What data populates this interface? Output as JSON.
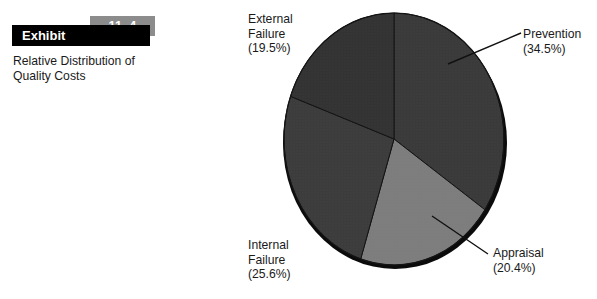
{
  "exhibit": {
    "label": "Exhibit",
    "number": "11–4",
    "caption": "Relative Distribution of\nQuality Costs"
  },
  "chart_data": {
    "type": "pie",
    "title": "Relative Distribution of Quality Costs",
    "legend_position": "callouts",
    "start_angle_deg": 0,
    "direction": "clockwise",
    "categories": [
      "Prevention",
      "Appraisal",
      "Internal Failure",
      "External Failure"
    ],
    "values": [
      34.5,
      20.4,
      25.6,
      19.5
    ],
    "value_unit": "%",
    "slices": [
      {
        "name": "Prevention",
        "label": "Prevention",
        "value_label": "(34.5%)",
        "value": 34.5,
        "color": "#3a3a3a"
      },
      {
        "name": "Appraisal",
        "label": "Appraisal",
        "value_label": "(20.4%)",
        "value": 20.4,
        "color": "#7d7d7d"
      },
      {
        "name": "Internal Failure",
        "label": "Internal\nFailure",
        "value_label": "(25.6%)",
        "value": 25.6,
        "color": "#3c3c3c"
      },
      {
        "name": "External Failure",
        "label": "External\nFailure",
        "value_label": "(19.5%)",
        "value": 19.5,
        "color": "#333333"
      }
    ],
    "colors": {
      "prevention": "#3a3a3a",
      "appraisal": "#7d7d7d",
      "internal_failure": "#3c3c3c",
      "external_failure": "#333333",
      "shadow": "#0b0b0b",
      "slice_outline": "#141414",
      "leader_line": "#111111"
    }
  },
  "callouts": {
    "external_failure": "External\nFailure\n(19.5%)",
    "prevention": "Prevention\n(34.5%)",
    "internal_failure": "Internal\nFailure\n(25.6%)",
    "appraisal": "Appraisal\n(20.4%)"
  }
}
